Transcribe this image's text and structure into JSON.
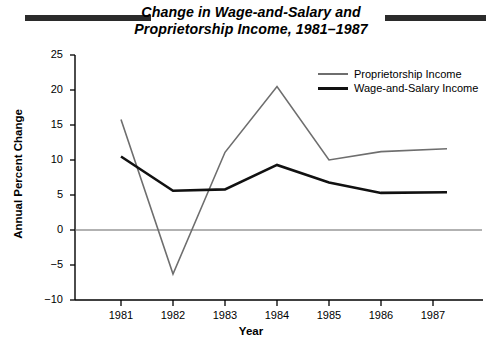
{
  "title": {
    "line1": "Change in Wage-and-Salary and",
    "line2": "Proprietorship Income, 1981–1987"
  },
  "axis": {
    "y_title": "Annual Percent Change",
    "x_title": "Year"
  },
  "legend": {
    "items": [
      {
        "label": "Proprietorship Income",
        "color": "#6e6e6e",
        "key": "proprietorship"
      },
      {
        "label": "Wage-and-Salary Income",
        "color": "#111111",
        "key": "wage"
      }
    ]
  },
  "chart_data": {
    "type": "line",
    "title": "Change in Wage-and-Salary and Proprietorship Income, 1981–1987",
    "xlabel": "Year",
    "ylabel": "Annual Percent Change",
    "categories": [
      "1981",
      "1982",
      "1983",
      "1984",
      "1985",
      "1986",
      "1987"
    ],
    "x": [
      1981,
      1982,
      1983,
      1984,
      1985,
      1986,
      1987
    ],
    "xlim": [
      1981,
      1987
    ],
    "ylim": [
      -10,
      25
    ],
    "yticks": [
      25,
      20,
      15,
      10,
      5,
      0,
      -5,
      -10
    ],
    "ytick_labels": [
      "25",
      "20",
      "15",
      "10",
      "5",
      "0",
      "−5",
      "−10"
    ],
    "xticks": [
      1981,
      1982,
      1983,
      1984,
      1985,
      1986,
      1987
    ],
    "grid": false,
    "zero_line": true,
    "legend_position": "top-right",
    "series": [
      {
        "name": "Proprietorship Income",
        "color": "#6e6e6e",
        "width": 1.6,
        "values": [
          15.8,
          -6.3,
          11.1,
          20.5,
          10.0,
          11.2,
          11.6
        ]
      },
      {
        "name": "Wage-and-Salary Income",
        "color": "#111111",
        "width": 2.6,
        "values": [
          10.5,
          5.6,
          5.8,
          9.3,
          6.8,
          5.3,
          5.4
        ]
      }
    ]
  }
}
